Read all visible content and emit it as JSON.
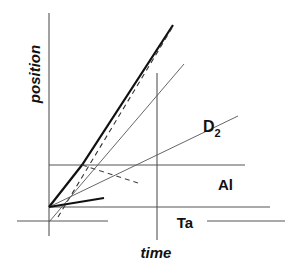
{
  "diagram": {
    "type": "position-time (x-t) wave diagram",
    "axes": {
      "x_label": "time",
      "y_label": "position"
    },
    "regions": [
      {
        "id": "d2",
        "label": "D",
        "subscript": "2"
      },
      {
        "id": "al",
        "label": "Al"
      },
      {
        "id": "ta",
        "label": "Ta"
      }
    ],
    "colors": {
      "line": "#222222",
      "thin_line": "#555555",
      "background": "#ffffff"
    }
  }
}
